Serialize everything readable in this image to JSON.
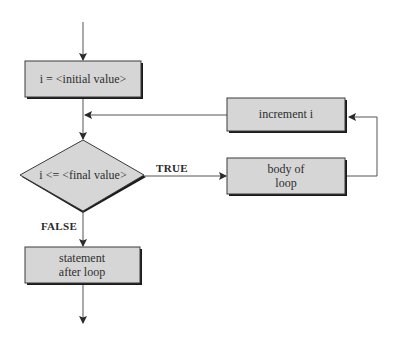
{
  "diagram": {
    "type": "flowchart",
    "title": "",
    "colors": {
      "box_fill": "#d6d6d6",
      "box_border": "#3a3a3a",
      "shadow": "#1a1a1a",
      "line": "#555555",
      "background": "#ffffff"
    },
    "nodes": {
      "init": {
        "lines": [
          "i = <initial value>"
        ]
      },
      "condition": {
        "lines": [
          "i <= <final value>"
        ]
      },
      "increment": {
        "lines": [
          "increment i"
        ]
      },
      "body": {
        "lines": [
          "body of",
          "loop"
        ]
      },
      "after": {
        "lines": [
          "statement",
          "after loop"
        ]
      }
    },
    "edge_labels": {
      "true": "TRUE",
      "false": "FALSE"
    },
    "edges": [
      {
        "from": "entry",
        "to": "init"
      },
      {
        "from": "init",
        "to": "condition"
      },
      {
        "from": "condition",
        "to": "body",
        "label": "TRUE"
      },
      {
        "from": "body",
        "to": "increment"
      },
      {
        "from": "increment",
        "to": "condition"
      },
      {
        "from": "condition",
        "to": "after",
        "label": "FALSE"
      },
      {
        "from": "after",
        "to": "exit"
      }
    ]
  }
}
